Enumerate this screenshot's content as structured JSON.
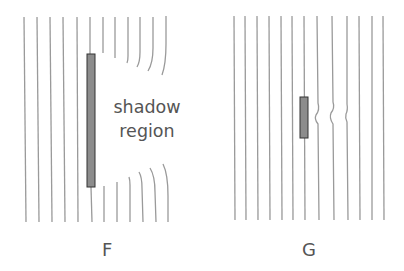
{
  "diagram": {
    "colors": {
      "wavefront": "#9a9a9a",
      "barrier_fill": "#8c8c8c",
      "barrier_stroke": "#333333",
      "text": "#555555"
    },
    "panels": [
      {
        "id": "F",
        "label": "F",
        "obstacle": "long barrier",
        "annotation": {
          "line1": "shadow",
          "line2": "region"
        }
      },
      {
        "id": "G",
        "label": "G",
        "obstacle": "short barrier"
      }
    ]
  }
}
